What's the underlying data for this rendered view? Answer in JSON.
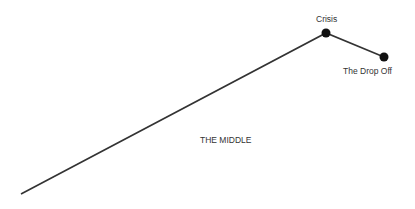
{
  "diagram": {
    "type": "line-arc",
    "line_color": "#333333",
    "dot_color": "#111111",
    "points": [
      {
        "name": "start",
        "x": 21,
        "y": 194
      },
      {
        "name": "crisis",
        "x": 326,
        "y": 33
      },
      {
        "name": "drop-off",
        "x": 384,
        "y": 57
      }
    ],
    "labels": {
      "crisis": "Crisis",
      "drop_off": "The Drop Off",
      "middle": "THE MIDDLE"
    }
  }
}
